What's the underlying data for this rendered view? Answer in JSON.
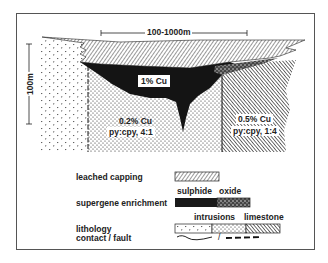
{
  "figure": {
    "type": "porphyry copper deposit cross-section",
    "horizontal_scale": "100-1000m",
    "vertical_scale": "100m"
  },
  "zones": {
    "enriched": {
      "label": "1% Cu"
    },
    "intrusion_zone": {
      "grade": "0.2% Cu",
      "ratio": "py:cpy, 4:1"
    },
    "limestone_zone": {
      "grade": "0.5% Cu",
      "ratio": "py:cpy, 1:4"
    }
  },
  "legend": {
    "leached_capping": {
      "label": "leached capping"
    },
    "supergene_enrichment": {
      "label": "supergene enrichment",
      "sub_labels": [
        "sulphide",
        "oxide"
      ]
    },
    "lithology": {
      "label": "lithology",
      "sub_labels": [
        "intrusions",
        "limestone"
      ]
    },
    "contact_fault": {
      "label": "contact / fault",
      "separator": "/"
    }
  },
  "colors": {
    "ink": "#1a1a1a",
    "frame": "#555555",
    "background": "#ffffff"
  }
}
